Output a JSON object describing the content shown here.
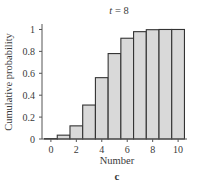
{
  "chart_data": {
    "type": "bar",
    "title_var": "t",
    "title_eq": " = ",
    "title_val": "8",
    "title": "t = 8",
    "xlabel": "Number",
    "ylabel": "Cumulative probability",
    "panel_label": "c",
    "categories": [
      0,
      1,
      2,
      3,
      4,
      5,
      6,
      7,
      8,
      9,
      10
    ],
    "values": [
      0.004,
      0.035,
      0.12,
      0.31,
      0.56,
      0.78,
      0.92,
      0.98,
      0.998,
      1.0,
      1.0
    ],
    "xlim": [
      -0.7,
      10.7
    ],
    "ylim": [
      0,
      1.05
    ],
    "xticks": [
      0,
      2,
      4,
      6,
      8,
      10
    ],
    "xtick_labels": [
      "0",
      "2",
      "4",
      "6",
      "8",
      "10"
    ],
    "yticks": [
      0,
      0.2,
      0.4,
      0.6,
      0.8,
      1
    ],
    "ytick_labels": [
      "0",
      "0.2",
      "0.4",
      "0.6",
      "0.8",
      "1"
    ],
    "grid": false,
    "bar_fill": "#d9d9d9",
    "bar_edge": "#333333"
  }
}
